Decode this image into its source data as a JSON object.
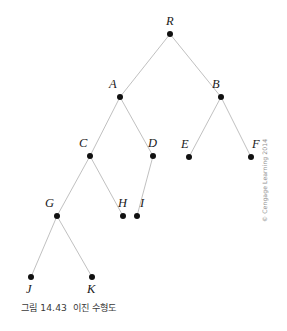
{
  "figure": {
    "caption_number": "그림 14.43",
    "caption_title": "이진 수형도",
    "copyright": "© Cengage Learning 2014",
    "background_color": "#ffffff",
    "edge_color": "#b9b9b9",
    "node_color": "#111111",
    "label_color": "#1a1a1a"
  },
  "chart_data": {
    "type": "diagram",
    "diagram_kind": "binary-tree",
    "nodes": [
      {
        "id": "R",
        "label": "R",
        "x": 170,
        "y": 34,
        "label_x": 166,
        "label_y": 15,
        "label_pos": "above"
      },
      {
        "id": "A",
        "label": "A",
        "x": 120,
        "y": 97,
        "label_x": 109,
        "label_y": 78,
        "label_pos": "upper-left"
      },
      {
        "id": "B",
        "label": "B",
        "x": 221,
        "y": 97,
        "label_x": 212,
        "label_y": 78,
        "label_pos": "upper-left"
      },
      {
        "id": "C",
        "label": "C",
        "x": 90,
        "y": 156,
        "label_x": 79,
        "label_y": 137,
        "label_pos": "upper-left"
      },
      {
        "id": "D",
        "label": "D",
        "x": 153,
        "y": 156,
        "label_x": 148,
        "label_y": 137,
        "label_pos": "upper-right"
      },
      {
        "id": "E",
        "label": "E",
        "x": 189,
        "y": 157,
        "label_x": 181,
        "label_y": 138,
        "label_pos": "upper-left"
      },
      {
        "id": "F",
        "label": "F",
        "x": 251,
        "y": 157,
        "label_x": 252,
        "label_y": 138,
        "label_pos": "upper-right"
      },
      {
        "id": "G",
        "label": "G",
        "x": 57,
        "y": 216,
        "label_x": 45,
        "label_y": 197,
        "label_pos": "upper-left"
      },
      {
        "id": "H",
        "label": "H",
        "x": 123,
        "y": 216,
        "label_x": 118,
        "label_y": 197,
        "label_pos": "upper-left"
      },
      {
        "id": "I",
        "label": "I",
        "x": 137,
        "y": 216,
        "label_x": 140,
        "label_y": 197,
        "label_pos": "upper-right"
      },
      {
        "id": "J",
        "label": "J",
        "x": 31,
        "y": 277,
        "label_x": 26,
        "label_y": 283,
        "label_pos": "below"
      },
      {
        "id": "K",
        "label": "K",
        "x": 92,
        "y": 277,
        "label_x": 87,
        "label_y": 283,
        "label_pos": "below"
      }
    ],
    "edges": [
      {
        "from": "R",
        "to": "A"
      },
      {
        "from": "R",
        "to": "B"
      },
      {
        "from": "A",
        "to": "C"
      },
      {
        "from": "A",
        "to": "D"
      },
      {
        "from": "B",
        "to": "E"
      },
      {
        "from": "B",
        "to": "F"
      },
      {
        "from": "C",
        "to": "G"
      },
      {
        "from": "C",
        "to": "H"
      },
      {
        "from": "D",
        "to": "I"
      },
      {
        "from": "G",
        "to": "J"
      },
      {
        "from": "G",
        "to": "K"
      }
    ],
    "root": "R",
    "levels": [
      [
        "R"
      ],
      [
        "A",
        "B"
      ],
      [
        "C",
        "D",
        "E",
        "F"
      ],
      [
        "G",
        "H",
        "I"
      ],
      [
        "J",
        "K"
      ]
    ],
    "node_radius": 3,
    "xlim": [
      0,
      287
    ],
    "ylim": [
      0,
      296
    ],
    "grid": false,
    "legend": false
  }
}
